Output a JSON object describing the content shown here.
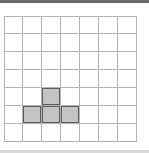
{
  "grid": {
    "rows": 7,
    "cols": 7,
    "shaded_cells": [
      [
        4,
        2
      ],
      [
        5,
        1
      ],
      [
        5,
        2
      ],
      [
        5,
        3
      ]
    ],
    "colors": {
      "line": "#b4b4b4",
      "fill": "#c4c4c4",
      "shaded_border": "#5c5c5c",
      "background": "#ffffff"
    }
  }
}
